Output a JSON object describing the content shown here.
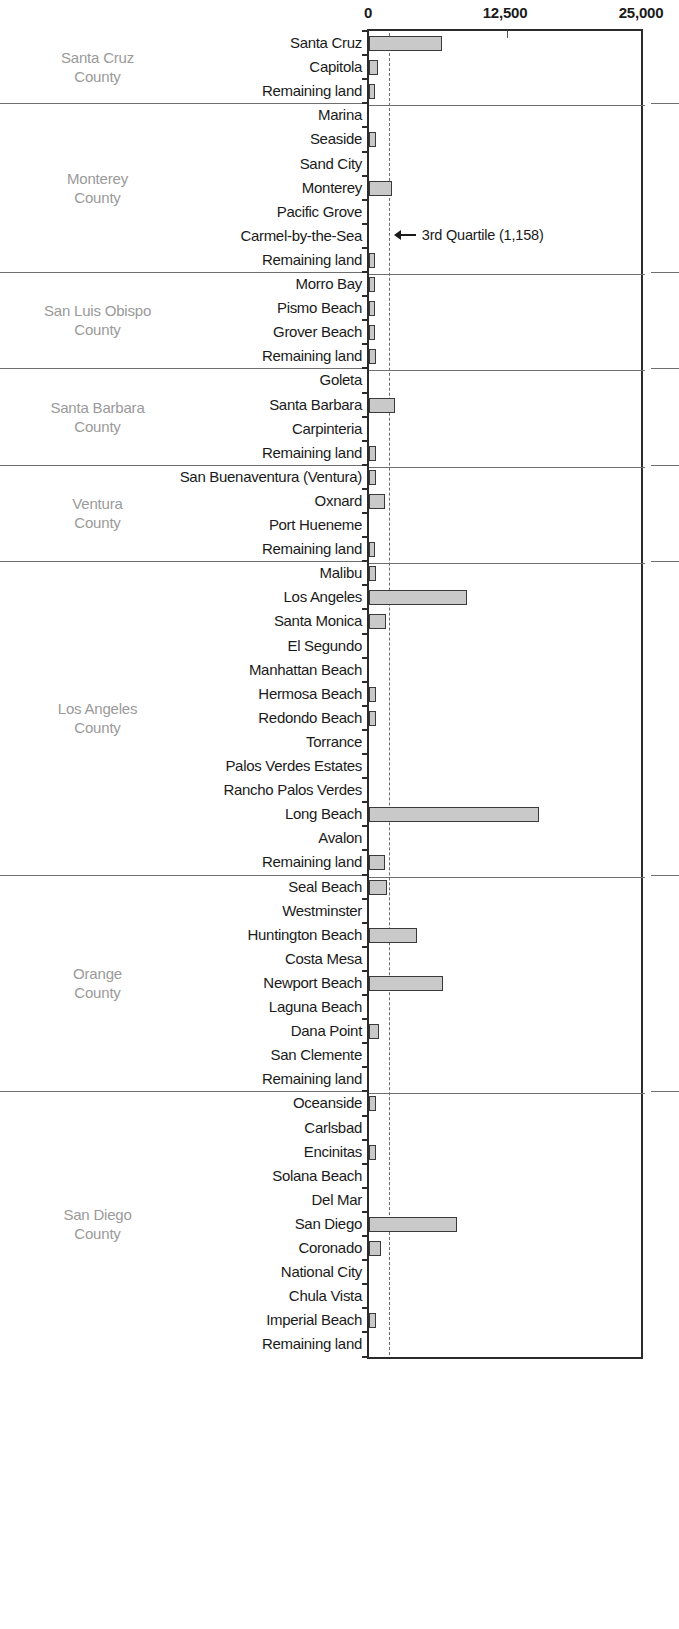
{
  "chart_data": {
    "type": "bar",
    "orientation": "horizontal",
    "title": "",
    "xlabel": "",
    "ylabel": "",
    "xlim": [
      0,
      25000
    ],
    "xticks": [
      0,
      12500,
      25000
    ],
    "xtick_labels": [
      "0",
      "12,500",
      "25,000"
    ],
    "grid": false,
    "legend": false,
    "annotations": [
      {
        "text": "3rd Quartile (1,158)",
        "value": 1158,
        "icon": "arrow-left-icon",
        "attached_to": "quartile-line"
      }
    ],
    "reference_lines": [
      {
        "name": "3rd Quartile",
        "value": 1158,
        "style": "dashed"
      }
    ],
    "groups": [
      {
        "name": "Santa Cruz County",
        "categories": [
          "Santa Cruz",
          "Capitola",
          "Remaining land"
        ],
        "values": [
          6600,
          800,
          530
        ]
      },
      {
        "name": "Monterey County",
        "categories": [
          "Marina",
          "Seaside",
          "Sand City",
          "Monterey",
          "Pacific Grove",
          "Carmel-by-the-Sea",
          "Remaining land"
        ],
        "values": [
          0,
          620,
          0,
          2100,
          0,
          0,
          530
        ]
      },
      {
        "name": "San Luis Obispo County",
        "categories": [
          "Morro Bay",
          "Pismo Beach",
          "Grover Beach",
          "Remaining land"
        ],
        "values": [
          560,
          560,
          560,
          620
        ]
      },
      {
        "name": "Santa Barbara County",
        "categories": [
          "Goleta",
          "Santa Barbara",
          "Carpinteria",
          "Remaining land"
        ],
        "values": [
          0,
          2350,
          0,
          620
        ]
      },
      {
        "name": "Ventura County",
        "categories": [
          "San Buenaventura (Ventura)",
          "Oxnard",
          "Port Hueneme",
          "Remaining land"
        ],
        "values": [
          620,
          1450,
          0,
          530
        ]
      },
      {
        "name": "Los Angeles County",
        "categories": [
          "Malibu",
          "Los Angeles",
          "Santa Monica",
          "El Segundo",
          "Manhattan Beach",
          "Hermosa Beach",
          "Redondo Beach",
          "Torrance",
          "Palos Verdes Estates",
          "Rancho Palos Verdes",
          "Long Beach",
          "Avalon",
          "Remaining land"
        ],
        "values": [
          620,
          8880,
          1550,
          0,
          0,
          620,
          620,
          0,
          0,
          0,
          15400,
          0,
          1450
        ]
      },
      {
        "name": "Orange County",
        "categories": [
          "Seal Beach",
          "Westminster",
          "Huntington Beach",
          "Costa Mesa",
          "Newport Beach",
          "Laguna Beach",
          "Dana Point",
          "San Clemente",
          "Remaining land"
        ],
        "values": [
          1650,
          0,
          4350,
          0,
          6700,
          0,
          890,
          0,
          0
        ]
      },
      {
        "name": "San Diego County",
        "categories": [
          "Oceanside",
          "Carlsbad",
          "Encinitas",
          "Solana Beach",
          "Del Mar",
          "San Diego",
          "Coronado",
          "National City",
          "Chula Vista",
          "Imperial Beach",
          "Remaining land"
        ],
        "values": [
          620,
          0,
          620,
          0,
          0,
          7970,
          1100,
          0,
          0,
          620,
          0
        ]
      }
    ],
    "colors": {
      "bar_fill": "#c9c9c9",
      "bar_stroke": "#3a3a3a",
      "axis": "#2b2b2b",
      "county_label": "#9a9a9a",
      "separator": "#6e6e6e",
      "quartile_line": "#6b6b6b",
      "text": "#1a1a1a"
    }
  }
}
